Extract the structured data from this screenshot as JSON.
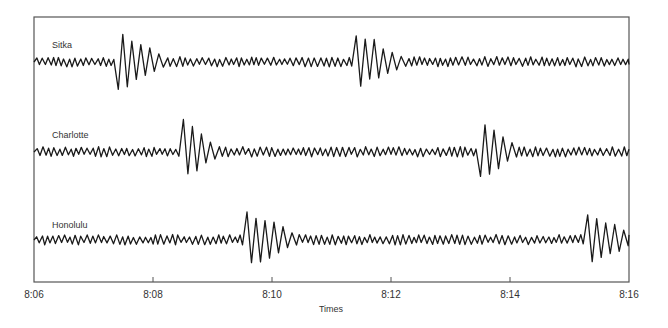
{
  "chart_data": {
    "type": "line",
    "title": "",
    "xlabel": "Times",
    "ylabel": "",
    "x_ticks": [
      "8:06",
      "8:08",
      "8:10",
      "8:12",
      "8:14",
      "8:16"
    ],
    "xlim": [
      "8:06",
      "8:16"
    ],
    "grid": false,
    "legend": "none (inline trace labels)",
    "series": [
      {
        "name": "Sitka",
        "baseline_y": 62,
        "arrivals": [
          {
            "start": "8:07.3",
            "end": "8:08.2",
            "peak_amp": 30
          },
          {
            "start": "8:11.3",
            "end": "8:12.2",
            "peak_amp": 30
          }
        ]
      },
      {
        "name": "Charlotte",
        "baseline_y": 152,
        "arrivals": [
          {
            "start": "8:08.4",
            "end": "8:09.1",
            "peak_amp": 30
          },
          {
            "start": "8:13.4",
            "end": "8:14.1",
            "peak_amp": 30
          }
        ]
      },
      {
        "name": "Honolulu",
        "baseline_y": 240,
        "arrivals": [
          {
            "start": "8:09.5",
            "end": "8:10.4",
            "peak_amp": 30
          },
          {
            "start": "8:15.2",
            "end": "8:16.0",
            "peak_amp": 30
          }
        ]
      }
    ]
  },
  "labels": {
    "sitka": "Sitka",
    "charlotte": "Charlotte",
    "honolulu": "Honolulu",
    "xlabel": "Times",
    "ticks": [
      "8:06",
      "8:08",
      "8:10",
      "8:12",
      "8:14",
      "8:16"
    ]
  }
}
